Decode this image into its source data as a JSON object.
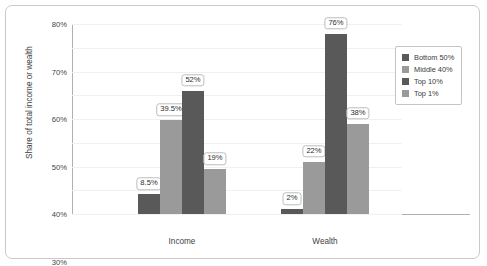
{
  "chart_data": {
    "type": "bar",
    "title": "",
    "xlabel": "",
    "ylabel": "Share of total income or wealth",
    "categories": [
      "Income",
      "Wealth"
    ],
    "ylim": [
      0,
      80
    ],
    "ytick_labels": [
      "0%",
      "10%",
      "20%",
      "30%",
      "40%",
      "50%",
      "60%",
      "70%",
      "80%"
    ],
    "ytick_values": [
      0,
      10,
      20,
      30,
      40,
      50,
      60,
      70,
      80
    ],
    "grid": true,
    "legend_position": "right",
    "series": [
      {
        "name": "Bottom 50%",
        "color": "#595959",
        "values": [
          8.5,
          2
        ],
        "data_labels": [
          "8.5%",
          "2%"
        ]
      },
      {
        "name": "Middle 40%",
        "color": "#9a9a9a",
        "values": [
          39.5,
          22
        ],
        "data_labels": [
          "39.5%",
          "22%"
        ]
      },
      {
        "name": "Top 10%",
        "color": "#595959",
        "values": [
          52,
          76
        ],
        "data_labels": [
          "52%",
          "76%"
        ]
      },
      {
        "name": "Top 1%",
        "color": "#9a9a9a",
        "values": [
          19,
          38
        ],
        "data_labels": [
          "19%",
          "38%"
        ]
      }
    ]
  }
}
